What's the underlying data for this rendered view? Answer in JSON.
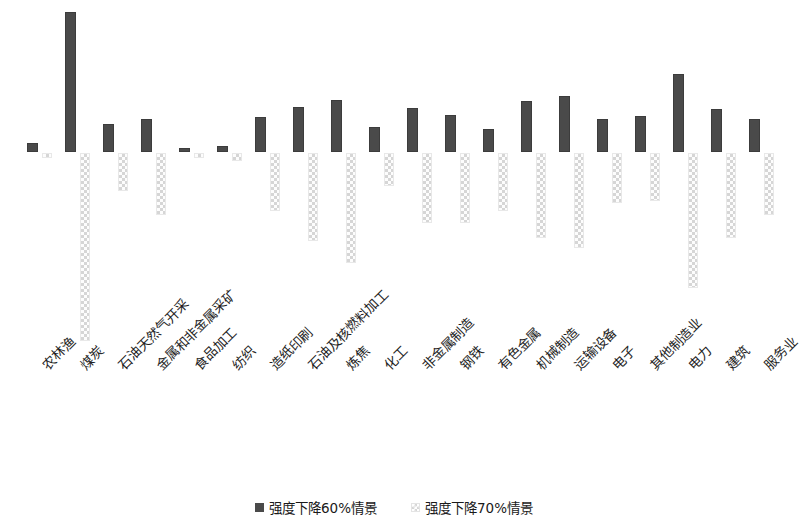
{
  "chart_data": {
    "type": "bar",
    "title": "",
    "subtitle": "",
    "xlabel": "",
    "ylabel": "",
    "orientation": "vertical",
    "grid": false,
    "axis_visible": false,
    "tick_labels_y": [],
    "legend_position": "bottom-center",
    "zero_baseline": true,
    "categories": [
      "农林渔",
      "煤炭",
      "石油天然气开采",
      "金属和非金属采矿",
      "食品加工",
      "纺织",
      "造纸印刷",
      "石油及核燃料加工",
      "炼焦",
      "化工",
      "非金属制造",
      "钢铁",
      "有色金属",
      "机械制造",
      "运输设备",
      "电子",
      "其他制造业",
      "电力",
      "建筑",
      "服务业"
    ],
    "series": [
      {
        "name": "强度下降60%情景",
        "color": "#4a4a4a",
        "pattern": "solid",
        "direction": "up",
        "values": [
          9,
          140,
          28,
          33,
          4,
          6,
          35,
          45,
          52,
          25,
          44,
          37,
          23,
          51,
          56,
          33,
          36,
          78,
          43,
          33
        ]
      },
      {
        "name": "强度下降70%情景",
        "color": "#d6d6d6",
        "pattern": "cross-hatch",
        "direction": "down",
        "values": [
          -5,
          -188,
          -38,
          -62,
          -5,
          -8,
          -58,
          -88,
          -110,
          -33,
          -70,
          -70,
          -58,
          -85,
          -95,
          -50,
          -48,
          -135,
          -85,
          -62
        ]
      }
    ],
    "ylim": [
      -200,
      150
    ]
  },
  "legend": {
    "items": [
      {
        "label": "强度下降60%情景",
        "swatch": "solid-square-marker"
      },
      {
        "label": "强度下降70%情景",
        "swatch": "cross-hatch-square-marker"
      }
    ]
  }
}
